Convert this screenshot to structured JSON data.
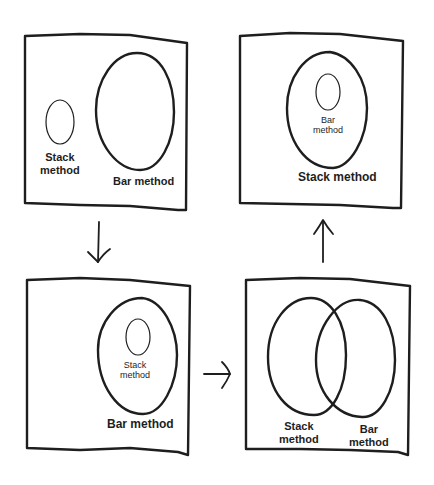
{
  "diagram": {
    "type": "sequence of Venn/Euler diagrams",
    "flow": [
      "panel_1",
      "panel_3",
      "panel_4",
      "panel_2"
    ],
    "panels": {
      "panel_1": {
        "position": "top-left",
        "description": "Two separate sets",
        "labels": {
          "stack": "Stack\nmethod",
          "bar": "Bar method"
        }
      },
      "panel_2": {
        "position": "top-right",
        "description": "Bar method inside Stack method",
        "labels": {
          "inner": "Bar\nmethod",
          "outer": "Stack method"
        }
      },
      "panel_3": {
        "position": "bottom-left",
        "description": "Stack method inside Bar method",
        "labels": {
          "inner": "Stack\nmethod",
          "outer": "Bar method"
        }
      },
      "panel_4": {
        "position": "bottom-right",
        "description": "Overlapping sets",
        "labels": {
          "stack": "Stack\nmethod",
          "bar": "Bar\nmethod"
        }
      }
    },
    "arrows": [
      {
        "from": "panel_1",
        "to": "panel_3",
        "direction": "down"
      },
      {
        "from": "panel_3",
        "to": "panel_4",
        "direction": "right"
      },
      {
        "from": "panel_4",
        "to": "panel_2",
        "direction": "up"
      }
    ],
    "colors": {
      "stroke": "#1e1e1e",
      "background": "#ffffff"
    }
  },
  "text": {
    "p1_stack_1": "Stack",
    "p1_stack_2": "method",
    "p1_bar": "Bar method",
    "p2_inner_1": "Bar",
    "p2_inner_2": "method",
    "p2_outer": "Stack method",
    "p3_inner_1": "Stack",
    "p3_inner_2": "method",
    "p3_outer": "Bar method",
    "p4_stack_1": "Stack",
    "p4_stack_2": "method",
    "p4_bar_1": "Bar",
    "p4_bar_2": "method"
  }
}
